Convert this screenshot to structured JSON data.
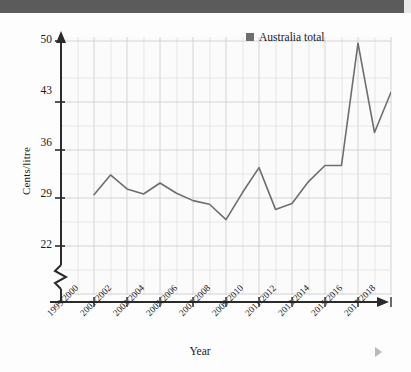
{
  "header": {
    "bar_color": "#5b5b5b"
  },
  "figure": {
    "background": "#fdfdfd",
    "plot_background": "#fbfbfb",
    "grid_color": "#d6d6d6",
    "axis_color": "#2b2b2b",
    "line_color": "#6e6e6e"
  },
  "legend": {
    "label": "Australia total",
    "swatch_color": "#6e6e6e",
    "position": "top-right-inside"
  },
  "icons": {
    "forward_marker": "play-triangle-icon"
  },
  "chart_data": {
    "type": "line",
    "title": "",
    "subtitle": "",
    "xlabel": "Year",
    "ylabel": "Cents/litre",
    "ylim": [
      22,
      50
    ],
    "y_axis_broken": true,
    "y_ticks": [
      22,
      29,
      36,
      43,
      50
    ],
    "y_tick_labels": [
      "22",
      "29",
      "36",
      "43",
      "50"
    ],
    "grid": true,
    "grid_minor": true,
    "x_tick_labels": [
      "1999/2000",
      "2001/2002",
      "2003/2004",
      "2005/2006",
      "2007/2008",
      "2009/2010",
      "2011/2012",
      "2013/2014",
      "2015/2016",
      "2017/2018"
    ],
    "categories": [
      "1999/2000",
      "2000/2001",
      "2001/2002",
      "2002/2003",
      "2003/2004",
      "2004/2005",
      "2005/2006",
      "2006/2007",
      "2007/2008",
      "2008/2009",
      "2009/2010",
      "2010/2011",
      "2011/2012",
      "2012/2013",
      "2013/2014",
      "2014/2015",
      "2015/2016",
      "2016/2017",
      "2017/2018"
    ],
    "series": [
      {
        "name": "Australia total",
        "color": "#6e6e6e",
        "values": [
          29.0,
          31.7,
          29.8,
          29.1,
          30.6,
          29.2,
          28.2,
          27.7,
          25.6,
          29.3,
          32.7,
          27.0,
          27.8,
          30.8,
          33.0,
          33.0,
          49.7,
          37.5,
          43.0
        ]
      }
    ]
  }
}
